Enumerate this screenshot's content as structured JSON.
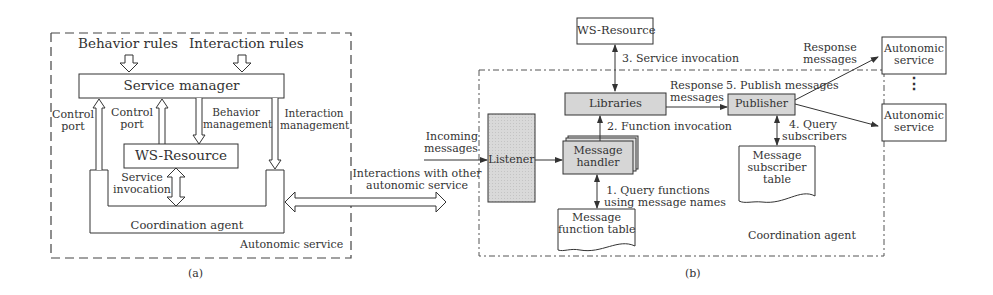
{
  "panel_a": {
    "caption": "(a)",
    "container_label": "Autonomic service",
    "behavior_rules": "Behavior rules",
    "interaction_rules": "Interaction rules",
    "service_manager": "Service manager",
    "control_port_outer": [
      "Control",
      "port"
    ],
    "control_port_inner": [
      "Control",
      "port"
    ],
    "behavior_management": [
      "Behavior",
      "management"
    ],
    "interaction_management": [
      "Interaction",
      "management"
    ],
    "ws_resource": "WS-Resource",
    "service_invocation": [
      "Service",
      "invocation"
    ],
    "coordination_agent": "Coordination agent"
  },
  "link": {
    "interactions": [
      "Interactions with other",
      "autonomic service"
    ]
  },
  "panel_b": {
    "caption": "(b)",
    "container_label": "Coordination agent",
    "ws_resource": "WS-Resource",
    "step3": "3. Service invocation",
    "libraries": "Libraries",
    "step2": "2. Function invocation",
    "incoming_messages": [
      "Incoming",
      "messages"
    ],
    "listener": "Listener",
    "message_handler": [
      "Message",
      "handler"
    ],
    "step1": [
      "1. Query functions",
      "using message names"
    ],
    "message_function_table": [
      "Message",
      "function table"
    ],
    "response_messages_mid": [
      "Response",
      "messages"
    ],
    "step5": "5. Publish messages",
    "publisher": "Publisher",
    "step4": [
      "4. Query",
      "subscribers"
    ],
    "message_subscriber_table": [
      "Message",
      "subscriber",
      "table"
    ],
    "response_messages_top": [
      "Response",
      "messages"
    ],
    "autonomic_service_1": [
      "Autonomic",
      "service"
    ],
    "autonomic_service_2": [
      "Autonomic",
      "service"
    ],
    "ellipsis": "⋮"
  },
  "colors": {
    "line": "#333333",
    "gray_box": "#d6d6d6",
    "dashed": "#555555"
  }
}
